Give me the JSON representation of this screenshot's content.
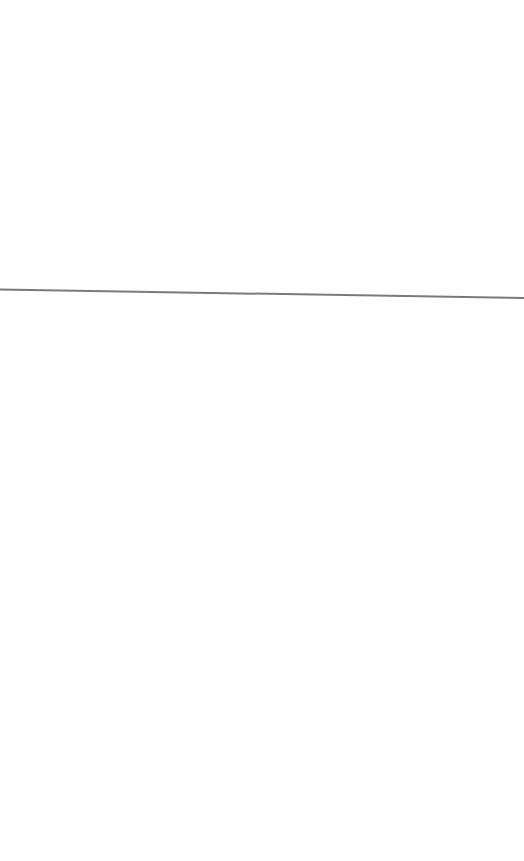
{
  "page": {
    "background": "#ffffff"
  },
  "divider": {
    "color": "#7a7a7a",
    "x1": 0,
    "y1": 289.5,
    "x2": 524,
    "y2": 298,
    "thickness": 2
  }
}
